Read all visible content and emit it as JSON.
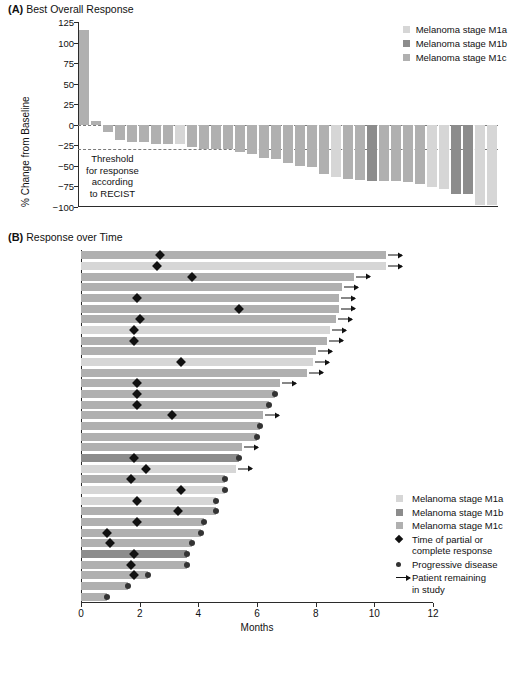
{
  "figure": {
    "panel_a": {
      "tag": "(A)",
      "title": "Best Overall Response",
      "y_axis_label": "% Change from Baseline",
      "threshold_note": "Threshold\nfor response\naccording\nto RECIST"
    },
    "panel_b": {
      "tag": "(B)",
      "title": "Response over Time",
      "x_axis_label": "Months"
    }
  },
  "colors": {
    "m1a": "#d6d6d6",
    "m1b": "#8c8c8c",
    "m1c": "#b0b0b0",
    "axis": "#2b2b2b",
    "marker": "#111111"
  },
  "legend_a": {
    "items": [
      {
        "label": "Melanoma stage M1a",
        "color": "#d6d6d6",
        "key": "m1a"
      },
      {
        "label": "Melanoma stage M1b",
        "color": "#8c8c8c",
        "key": "m1b"
      },
      {
        "label": "Melanoma stage M1c",
        "color": "#b0b0b0",
        "key": "m1c"
      }
    ]
  },
  "legend_b": {
    "items": [
      {
        "label": "Melanoma stage M1a",
        "mark": "swatch",
        "color": "#d6d6d6"
      },
      {
        "label": "Melanoma stage M1b",
        "mark": "swatch",
        "color": "#8c8c8c"
      },
      {
        "label": "Melanoma stage M1c",
        "mark": "swatch",
        "color": "#b0b0b0"
      },
      {
        "label": "Time of partial or\ncomplete response",
        "mark": "diamond",
        "color": "#111111"
      },
      {
        "label": "Progressive disease",
        "mark": "dot",
        "color": "#333333"
      },
      {
        "label": "Patient remaining\nin study",
        "mark": "arrow",
        "color": "#111111"
      }
    ]
  },
  "chart_data": [
    {
      "type": "bar",
      "title": "Best Overall Response",
      "xlabel": "",
      "ylabel": "% Change from Baseline",
      "ylim": [
        -100,
        125
      ],
      "yticks": [
        125,
        100,
        75,
        50,
        25,
        0,
        -25,
        -50,
        -75,
        -100
      ],
      "grid": false,
      "reference_lines": [
        {
          "value": 0,
          "style": "dashed"
        },
        {
          "value": -30,
          "style": "dashed",
          "note": "Threshold for response according to RECIST"
        }
      ],
      "legend_position": "top-right",
      "series": [
        {
          "name": "Best percent change from baseline",
          "values": [
            115,
            5,
            -9,
            -19,
            -21,
            -21,
            -23,
            -24,
            -24,
            -27,
            -29,
            -30,
            -30,
            -33,
            -35,
            -41,
            -42,
            -47,
            -50,
            -51,
            -60,
            -63,
            -66,
            -67,
            -68,
            -69,
            -69,
            -70,
            -72,
            -76,
            -78,
            -84,
            -84,
            -97,
            -97
          ],
          "stages": [
            "m1c",
            "m1c",
            "m1c",
            "m1c",
            "m1c",
            "m1c",
            "m1c",
            "m1c",
            "m1a",
            "m1c",
            "m1c",
            "m1c",
            "m1c",
            "m1c",
            "m1c",
            "m1c",
            "m1c",
            "m1c",
            "m1c",
            "m1c",
            "m1c",
            "m1a",
            "m1c",
            "m1c",
            "m1b",
            "m1c",
            "m1c",
            "m1c",
            "m1c",
            "m1a",
            "m1a",
            "m1b",
            "m1b",
            "m1a",
            "m1a"
          ]
        }
      ]
    },
    {
      "type": "bar",
      "orientation": "horizontal",
      "title": "Response over Time",
      "xlabel": "Months",
      "ylabel": "",
      "xlim": [
        0,
        12
      ],
      "xticks": [
        0,
        2,
        4,
        6,
        8,
        10,
        12
      ],
      "grid": false,
      "legend_position": "right",
      "rows": [
        {
          "duration": 10.4,
          "stage": "m1c",
          "response_time": 2.7,
          "ongoing": true,
          "progression": false
        },
        {
          "duration": 10.4,
          "stage": "m1a",
          "response_time": 2.6,
          "ongoing": true,
          "progression": false
        },
        {
          "duration": 9.3,
          "stage": "m1c",
          "response_time": 3.8,
          "ongoing": true,
          "progression": false
        },
        {
          "duration": 8.9,
          "stage": "m1c",
          "response_time": null,
          "ongoing": true,
          "progression": false
        },
        {
          "duration": 8.8,
          "stage": "m1c",
          "response_time": 1.9,
          "ongoing": true,
          "progression": false
        },
        {
          "duration": 8.8,
          "stage": "m1c",
          "response_time": 5.4,
          "ongoing": true,
          "progression": false
        },
        {
          "duration": 8.7,
          "stage": "m1c",
          "response_time": 2.0,
          "ongoing": true,
          "progression": false
        },
        {
          "duration": 8.5,
          "stage": "m1a",
          "response_time": 1.8,
          "ongoing": true,
          "progression": false
        },
        {
          "duration": 8.4,
          "stage": "m1c",
          "response_time": 1.8,
          "ongoing": true,
          "progression": false
        },
        {
          "duration": 8.0,
          "stage": "m1c",
          "response_time": null,
          "ongoing": true,
          "progression": false
        },
        {
          "duration": 7.9,
          "stage": "m1a",
          "response_time": 3.4,
          "ongoing": true,
          "progression": false
        },
        {
          "duration": 7.7,
          "stage": "m1c",
          "response_time": null,
          "ongoing": true,
          "progression": false
        },
        {
          "duration": 6.8,
          "stage": "m1c",
          "response_time": 1.9,
          "ongoing": true,
          "progression": false
        },
        {
          "duration": 6.6,
          "stage": "m1c",
          "response_time": 1.9,
          "ongoing": false,
          "progression": true
        },
        {
          "duration": 6.4,
          "stage": "m1c",
          "response_time": 1.9,
          "ongoing": false,
          "progression": true
        },
        {
          "duration": 6.2,
          "stage": "m1c",
          "response_time": 3.1,
          "ongoing": true,
          "progression": false
        },
        {
          "duration": 6.1,
          "stage": "m1c",
          "response_time": null,
          "ongoing": false,
          "progression": true
        },
        {
          "duration": 6.0,
          "stage": "m1c",
          "response_time": null,
          "ongoing": false,
          "progression": true
        },
        {
          "duration": 5.5,
          "stage": "m1c",
          "response_time": null,
          "ongoing": true,
          "progression": false
        },
        {
          "duration": 5.4,
          "stage": "m1b",
          "response_time": 1.8,
          "ongoing": false,
          "progression": true
        },
        {
          "duration": 5.3,
          "stage": "m1a",
          "response_time": 2.2,
          "ongoing": true,
          "progression": false
        },
        {
          "duration": 4.9,
          "stage": "m1c",
          "response_time": 1.7,
          "ongoing": false,
          "progression": true
        },
        {
          "duration": 4.9,
          "stage": "m1a",
          "response_time": 3.4,
          "ongoing": false,
          "progression": true
        },
        {
          "duration": 4.6,
          "stage": "m1a",
          "response_time": 1.9,
          "ongoing": false,
          "progression": true
        },
        {
          "duration": 4.6,
          "stage": "m1c",
          "response_time": 3.3,
          "ongoing": false,
          "progression": true
        },
        {
          "duration": 4.2,
          "stage": "m1c",
          "response_time": 1.9,
          "ongoing": false,
          "progression": true
        },
        {
          "duration": 4.1,
          "stage": "m1c",
          "response_time": 0.9,
          "ongoing": false,
          "progression": true
        },
        {
          "duration": 3.8,
          "stage": "m1c",
          "response_time": 1.0,
          "ongoing": false,
          "progression": true
        },
        {
          "duration": 3.6,
          "stage": "m1b",
          "response_time": 1.8,
          "ongoing": false,
          "progression": true
        },
        {
          "duration": 3.6,
          "stage": "m1c",
          "response_time": 1.7,
          "ongoing": false,
          "progression": true
        },
        {
          "duration": 2.3,
          "stage": "m1c",
          "response_time": 1.8,
          "ongoing": false,
          "progression": true
        },
        {
          "duration": 1.6,
          "stage": "m1c",
          "response_time": null,
          "ongoing": false,
          "progression": true
        },
        {
          "duration": 0.9,
          "stage": "m1c",
          "response_time": null,
          "ongoing": false,
          "progression": true
        }
      ]
    }
  ]
}
